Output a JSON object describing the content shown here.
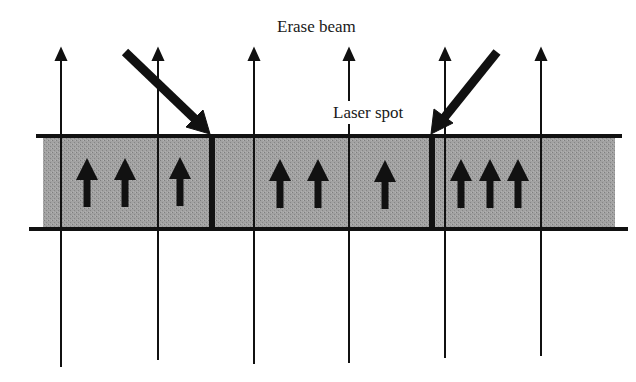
{
  "diagram": {
    "labels": {
      "erase_beam": "Erase beam",
      "laser_spot": "Laser spot"
    },
    "colors": {
      "band": "#9c9c9c",
      "ink": "#111111",
      "background": "#ffffff"
    },
    "medium": {
      "top_line_y": 136,
      "bottom_line_y": 229,
      "band_x": [
        43,
        615
      ]
    },
    "field_lines_x": [
      61,
      158,
      254,
      349,
      445,
      541
    ],
    "domain_walls_x": [
      212,
      432
    ],
    "magnetization_arrows_x": [
      87,
      125,
      180,
      280,
      318,
      385,
      461,
      490,
      518
    ],
    "beams": [
      {
        "name": "erase-beam-arrow",
        "from": [
          123,
          50
        ],
        "to": [
          210,
          134
        ]
      },
      {
        "name": "laser-beam-arrow",
        "from": [
          499,
          50
        ],
        "to": [
          431,
          134
        ]
      }
    ]
  }
}
